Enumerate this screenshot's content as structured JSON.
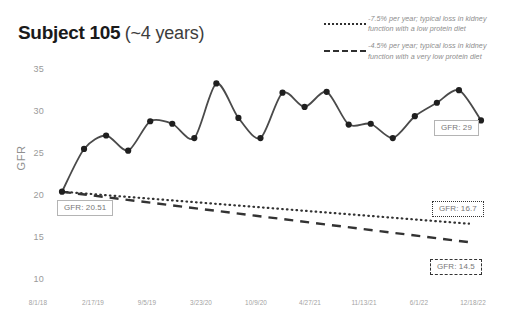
{
  "title": {
    "main": "Subject 105",
    "sub": "(~4 years)"
  },
  "legend": {
    "items": [
      {
        "style": "dotted",
        "label": "-7.5% per year; typical loss in kidney function with a low protein diet"
      },
      {
        "style": "dashed",
        "label": "-4.5% per year; typical loss in kidney function with a very low protein diet"
      }
    ]
  },
  "callouts": {
    "start": "GFR: 20.51",
    "end": "GFR: 29",
    "dotted_end": "GFR: 16.7",
    "dashed_end": "GFR: 14.5"
  },
  "chart_data": {
    "type": "line",
    "title": "Subject 105 (~4 years)",
    "xlabel": "",
    "ylabel": "GFR",
    "ylim": [
      10,
      35
    ],
    "yticks": [
      35,
      30,
      25,
      20,
      15,
      10
    ],
    "xticks": [
      "8/1/18",
      "2/17/19",
      "9/5/19",
      "3/23/20",
      "10/9/20",
      "4/27/21",
      "11/13/21",
      "6/1/22",
      "12/18/22"
    ],
    "grid": false,
    "legend_position": "top-right",
    "series": [
      {
        "name": "Measured GFR",
        "style": "solid",
        "color": "#4a4a4a",
        "markers": true,
        "x": [
          "8/1/18",
          "11/20/18",
          "2/17/19",
          "5/10/19",
          "8/1/19",
          "10/20/19",
          "1/10/20",
          "3/23/20",
          "6/10/20",
          "8/25/20",
          "11/10/20",
          "1/25/21",
          "4/27/21",
          "7/15/21",
          "10/1/21",
          "12/18/21",
          "3/10/22",
          "6/1/22",
          "9/1/22",
          "12/18/22"
        ],
        "values": [
          20.51,
          25.6,
          27.2,
          25.4,
          28.9,
          28.6,
          26.9,
          33.4,
          29.3,
          26.9,
          32.3,
          30.6,
          32.4,
          28.5,
          28.6,
          26.9,
          29.5,
          31.1,
          32.6,
          29.0
        ]
      },
      {
        "name": "-7.5% per year; typical loss in kidney function with a low protein diet",
        "style": "dotted",
        "color": "#333333",
        "markers": false,
        "endpoints": [
          {
            "x": "8/1/18",
            "y": 20.51
          },
          {
            "x": "12/18/22",
            "y": 16.7
          }
        ]
      },
      {
        "name": "-4.5% per year; typical loss in kidney function with a very low protein diet",
        "style": "dashed",
        "color": "#333333",
        "markers": false,
        "endpoints": [
          {
            "x": "8/1/18",
            "y": 20.51
          },
          {
            "x": "12/18/22",
            "y": 14.5
          }
        ]
      }
    ],
    "annotations": [
      {
        "text": "GFR: 20.51",
        "anchor_value": 20.51,
        "position": "below-left"
      },
      {
        "text": "GFR: 29",
        "anchor_value": 29.0,
        "position": "below-right"
      },
      {
        "text": "GFR: 16.7",
        "anchor_value": 16.7,
        "position": "right"
      },
      {
        "text": "GFR: 14.5",
        "anchor_value": 14.5,
        "position": "right"
      }
    ]
  },
  "axes": {
    "y_ticks": [
      {
        "label": "35",
        "value": 35
      },
      {
        "label": "30",
        "value": 30
      },
      {
        "label": "25",
        "value": 25
      },
      {
        "label": "20",
        "value": 20
      },
      {
        "label": "15",
        "value": 15
      },
      {
        "label": "10",
        "value": 10
      }
    ],
    "y_title": "GFR",
    "x_ticks": [
      {
        "label": "8/1/18"
      },
      {
        "label": "2/17/19"
      },
      {
        "label": "9/5/19"
      },
      {
        "label": "3/23/20"
      },
      {
        "label": "10/9/20"
      },
      {
        "label": "4/27/21"
      },
      {
        "label": "11/13/21"
      },
      {
        "label": "6/1/22"
      },
      {
        "label": "12/18/22"
      }
    ]
  }
}
